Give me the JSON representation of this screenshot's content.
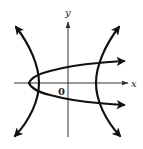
{
  "figure": {
    "axes": {
      "x_label": "x",
      "y_label": "y",
      "origin_label": "0"
    },
    "curves": [
      {
        "name": "parabola",
        "opens": "right",
        "vertex_px": [
          29,
          83
        ]
      },
      {
        "name": "hyperbola-left-branch",
        "vertex_px": [
          39,
          83
        ]
      },
      {
        "name": "hyperbola-right-branch",
        "vertex_px": [
          96,
          83
        ]
      }
    ],
    "colors": {
      "curve": "#111111",
      "axis": "#333333",
      "background": "#ffffff"
    }
  }
}
